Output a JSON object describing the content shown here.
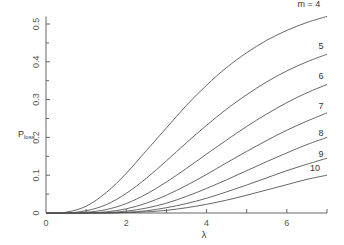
{
  "chart_data": {
    "type": "line",
    "title": "",
    "xlabel": "λ",
    "ylabel": "P_loss",
    "ylabel_main": "P",
    "ylabel_sub": "loss",
    "xlim": [
      0,
      7
    ],
    "ylim": [
      0,
      0.52
    ],
    "x_ticks": [
      0,
      2,
      4,
      6
    ],
    "x_minor_ticks": [
      1,
      3,
      5,
      7
    ],
    "y_ticks": [
      0,
      0.1,
      0.2,
      0.3,
      0.4,
      0.5
    ],
    "y_tick_labels": [
      "0",
      "0.1",
      "0.2",
      "0.3",
      "0.4",
      "0.5"
    ],
    "y_minor_ticks": [
      0.05,
      0.15,
      0.25,
      0.35,
      0.45
    ],
    "origin_x_label": "0",
    "grid": false,
    "legend": "inline labels at right end of curves",
    "x": [
      0,
      0.5,
      1,
      1.5,
      2,
      2.5,
      3,
      3.5,
      4,
      4.5,
      5,
      5.5,
      6,
      6.5,
      7
    ],
    "series": [
      {
        "name": "m = 4",
        "label": "m = 4",
        "values": [
          0,
          0.002,
          0.018,
          0.054,
          0.105,
          0.165,
          0.225,
          0.285,
          0.338,
          0.385,
          0.424,
          0.457,
          0.483,
          0.504,
          0.52
        ]
      },
      {
        "name": "5",
        "label": "5",
        "values": [
          0,
          0.0,
          0.006,
          0.022,
          0.052,
          0.092,
          0.138,
          0.186,
          0.232,
          0.275,
          0.313,
          0.347,
          0.376,
          0.4,
          0.42
        ]
      },
      {
        "name": "6",
        "label": "6",
        "values": [
          0,
          0.0,
          0.002,
          0.009,
          0.025,
          0.05,
          0.082,
          0.118,
          0.156,
          0.193,
          0.229,
          0.262,
          0.292,
          0.318,
          0.34
        ]
      },
      {
        "name": "7",
        "label": "7",
        "values": [
          0,
          0.0,
          0.0,
          0.003,
          0.011,
          0.026,
          0.047,
          0.073,
          0.102,
          0.133,
          0.163,
          0.192,
          0.219,
          0.243,
          0.265
        ]
      },
      {
        "name": "8",
        "label": "8",
        "values": [
          0,
          0.0,
          0.0,
          0.001,
          0.005,
          0.013,
          0.026,
          0.044,
          0.065,
          0.088,
          0.112,
          0.136,
          0.159,
          0.181,
          0.2
        ]
      },
      {
        "name": "9",
        "label": "9",
        "values": [
          0,
          0.0,
          0.0,
          0.0,
          0.002,
          0.006,
          0.014,
          0.025,
          0.039,
          0.056,
          0.074,
          0.093,
          0.112,
          0.129,
          0.145
        ]
      },
      {
        "name": "10",
        "label": "10",
        "values": [
          0,
          0.0,
          0.0,
          0.0,
          0.001,
          0.003,
          0.007,
          0.014,
          0.023,
          0.034,
          0.047,
          0.061,
          0.075,
          0.089,
          0.1
        ]
      }
    ],
    "label_positions": [
      {
        "label": "m = 4",
        "x": 6.55,
        "y": 0.545
      },
      {
        "label": "5",
        "x": 6.85,
        "y": 0.435
      },
      {
        "label": "6",
        "x": 6.85,
        "y": 0.355
      },
      {
        "label": "7",
        "x": 6.85,
        "y": 0.275
      },
      {
        "label": "8",
        "x": 6.85,
        "y": 0.205
      },
      {
        "label": "9",
        "x": 6.85,
        "y": 0.148
      },
      {
        "label": "10",
        "x": 6.7,
        "y": 0.11
      }
    ]
  },
  "colors": {
    "axis": "#666666",
    "curve": "#555555",
    "text": "#444444",
    "background": "#ffffff"
  }
}
